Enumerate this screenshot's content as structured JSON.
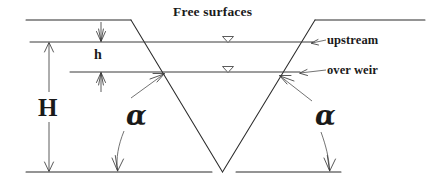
{
  "figure": {
    "kind": "engineering-cross-section",
    "background_color": "#ffffff",
    "line_color": "#2b2b2b",
    "text_color": "#1a1a1a"
  },
  "labels": {
    "free_surfaces": "Free surfaces",
    "upstream": "upstream",
    "over_weir": "over weir",
    "total_head": "H",
    "head_over_weir": "h",
    "angle_left": "α",
    "angle_right": "α"
  },
  "geometry": {
    "top_left_edge": {
      "x1": 26,
      "y1": 20,
      "x2": 131,
      "y2": 20
    },
    "top_right_edge": {
      "x1": 315,
      "y1": 20,
      "x2": 425,
      "y2": 20
    },
    "notch_left_side": {
      "x1": 131,
      "y1": 20,
      "x2": 222,
      "y2": 172
    },
    "notch_right_side": {
      "x1": 222,
      "y1": 172,
      "x2": 315,
      "y2": 20
    },
    "baseline_left": {
      "x1": 26,
      "y1": 172,
      "x2": 212,
      "y2": 172
    },
    "baseline_right": {
      "x1": 237,
      "y1": 172,
      "x2": 341,
      "y2": 172
    },
    "upstream_surface": {
      "x1": 30,
      "y1": 42,
      "x2": 313,
      "y2": 42
    },
    "over_weir_surface": {
      "x1": 70,
      "y1": 72,
      "x2": 300,
      "y2": 72
    },
    "H_dimension": {
      "x": 49,
      "y_top": 42,
      "y_bottom": 172
    },
    "h_dimension": {
      "x": 101,
      "y_top": 42,
      "y_bottom": 72
    },
    "surface_markers": [
      {
        "x": 228,
        "y": 42
      },
      {
        "x": 228,
        "y": 72
      }
    ]
  },
  "leaders": [
    {
      "name": "upstream-leader",
      "from_x": 325,
      "from_y": 40,
      "to_x": 311,
      "to_y": 43
    },
    {
      "name": "over-weir-leader",
      "from_x": 325,
      "from_y": 70,
      "to_x": 299,
      "to_y": 73
    },
    {
      "name": "alpha-left-up-leader",
      "from_x": 132,
      "from_y": 97,
      "to_x": 163,
      "to_y": 74
    },
    {
      "name": "alpha-left-down-leader",
      "from_x": 122,
      "from_y": 132,
      "to_x": 118,
      "to_y": 170
    },
    {
      "name": "alpha-right-up-leader",
      "from_x": 311,
      "from_y": 100,
      "to_x": 281,
      "to_y": 76
    },
    {
      "name": "alpha-right-down-leader",
      "from_x": 322,
      "from_y": 133,
      "to_x": 330,
      "to_y": 170
    }
  ]
}
